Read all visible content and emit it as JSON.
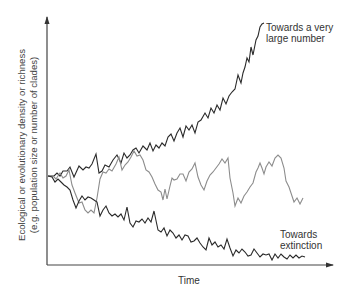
{
  "chart_data": {
    "type": "line",
    "title": "",
    "xlabel": "Time",
    "ylabel": "Ecological or evolutionary density or richness (e.g. population size or number of clades)",
    "ylabel_lines": [
      "Ecological or evolutionary density or richness",
      "(e.g. population size or number of clades)"
    ],
    "grid": false,
    "legend": "none",
    "annotations": [
      {
        "text_lines": [
          "Towards a very",
          "large number"
        ],
        "near_series": "upward"
      },
      {
        "text_lines": [
          "Towards",
          "extinction"
        ],
        "near_series": "downward"
      }
    ],
    "series": [
      {
        "name": "upward",
        "description": "Random walk trending towards a very large number",
        "color": "#2a2a2a",
        "points": [
          [
            48,
            176
          ],
          [
            54,
            176
          ],
          [
            57,
            173
          ],
          [
            60,
            176
          ],
          [
            63,
            171
          ],
          [
            67,
            171
          ],
          [
            70,
            167
          ],
          [
            74,
            177
          ],
          [
            79,
            166
          ],
          [
            83,
            170
          ],
          [
            86,
            167
          ],
          [
            89,
            168
          ],
          [
            92,
            164
          ],
          [
            96,
            154
          ],
          [
            99,
            173
          ],
          [
            102,
            171
          ],
          [
            105,
            165
          ],
          [
            109,
            167
          ],
          [
            113,
            160
          ],
          [
            117,
            155
          ],
          [
            121,
            163
          ],
          [
            124,
            153
          ],
          [
            127,
            158
          ],
          [
            130,
            155
          ],
          [
            133,
            150
          ],
          [
            136,
            148
          ],
          [
            139,
            153
          ],
          [
            143,
            146
          ],
          [
            147,
            150
          ],
          [
            150,
            143
          ],
          [
            153,
            151
          ],
          [
            156,
            145
          ],
          [
            159,
            148
          ],
          [
            162,
            143
          ],
          [
            165,
            146
          ],
          [
            168,
            137
          ],
          [
            171,
            134
          ],
          [
            174,
            141
          ],
          [
            177,
            133
          ],
          [
            180,
            128
          ],
          [
            183,
            137
          ],
          [
            186,
            126
          ],
          [
            189,
            130
          ],
          [
            192,
            125
          ],
          [
            195,
            133
          ],
          [
            198,
            122
          ],
          [
            201,
            120
          ],
          [
            205,
            113
          ],
          [
            208,
            118
          ],
          [
            211,
            108
          ],
          [
            214,
            113
          ],
          [
            217,
            105
          ],
          [
            220,
            110
          ],
          [
            223,
            98
          ],
          [
            226,
            104
          ],
          [
            229,
            96
          ],
          [
            232,
            92
          ],
          [
            235,
            89
          ],
          [
            238,
            75
          ],
          [
            241,
            83
          ],
          [
            243,
            73
          ],
          [
            245,
            67
          ],
          [
            247,
            58
          ],
          [
            249,
            62
          ],
          [
            251,
            47
          ],
          [
            253,
            55
          ],
          [
            256,
            40
          ],
          [
            258,
            36
          ],
          [
            260,
            27
          ],
          [
            262,
            24
          ],
          [
            264,
            23
          ]
        ]
      },
      {
        "name": "fluctuating",
        "description": "Random walk fluctuating around a level",
        "color": "#8c8c8c",
        "points": [
          [
            48,
            176
          ],
          [
            53,
            176
          ],
          [
            56,
            179
          ],
          [
            60,
            173
          ],
          [
            63,
            178
          ],
          [
            66,
            176
          ],
          [
            69,
            170
          ],
          [
            72,
            185
          ],
          [
            75,
            193
          ],
          [
            79,
            203
          ],
          [
            82,
            202
          ],
          [
            85,
            210
          ],
          [
            88,
            213
          ],
          [
            91,
            210
          ],
          [
            94,
            213
          ],
          [
            97,
            198
          ],
          [
            100,
            179
          ],
          [
            103,
            172
          ],
          [
            106,
            173
          ],
          [
            109,
            169
          ],
          [
            112,
            171
          ],
          [
            116,
            164
          ],
          [
            119,
            157
          ],
          [
            122,
            170
          ],
          [
            125,
            165
          ],
          [
            128,
            162
          ],
          [
            131,
            157
          ],
          [
            134,
            151
          ],
          [
            137,
            156
          ],
          [
            140,
            155
          ],
          [
            143,
            160
          ],
          [
            146,
            170
          ],
          [
            149,
            172
          ],
          [
            152,
            177
          ],
          [
            155,
            184
          ],
          [
            158,
            190
          ],
          [
            161,
            192
          ],
          [
            163,
            200
          ],
          [
            165,
            189
          ],
          [
            167,
            199
          ],
          [
            170,
            186
          ],
          [
            172,
            178
          ],
          [
            174,
            180
          ],
          [
            177,
            179
          ],
          [
            180,
            174
          ],
          [
            183,
            174
          ],
          [
            186,
            181
          ],
          [
            189,
            172
          ],
          [
            192,
            169
          ],
          [
            195,
            163
          ],
          [
            198,
            177
          ],
          [
            201,
            185
          ],
          [
            204,
            190
          ],
          [
            207,
            181
          ],
          [
            210,
            175
          ],
          [
            213,
            172
          ],
          [
            216,
            168
          ],
          [
            219,
            164
          ],
          [
            222,
            159
          ],
          [
            225,
            163
          ],
          [
            228,
            158
          ],
          [
            230,
            178
          ],
          [
            233,
            193
          ],
          [
            235,
            206
          ],
          [
            238,
            198
          ],
          [
            241,
            203
          ],
          [
            244,
            196
          ],
          [
            247,
            192
          ],
          [
            250,
            187
          ],
          [
            253,
            183
          ],
          [
            256,
            172
          ],
          [
            258,
            168
          ],
          [
            260,
            163
          ],
          [
            262,
            168
          ],
          [
            264,
            174
          ],
          [
            266,
            167
          ],
          [
            269,
            162
          ],
          [
            272,
            166
          ],
          [
            275,
            158
          ],
          [
            278,
            155
          ],
          [
            281,
            158
          ],
          [
            284,
            168
          ],
          [
            286,
            181
          ],
          [
            289,
            187
          ],
          [
            292,
            196
          ],
          [
            294,
            202
          ],
          [
            297,
            198
          ],
          [
            300,
            204
          ],
          [
            303,
            198
          ]
        ]
      },
      {
        "name": "downward",
        "description": "Random walk trending towards extinction",
        "color": "#2a2a2a",
        "points": [
          [
            48,
            176
          ],
          [
            52,
            177
          ],
          [
            55,
            182
          ],
          [
            58,
            179
          ],
          [
            61,
            182
          ],
          [
            64,
            185
          ],
          [
            67,
            187
          ],
          [
            70,
            190
          ],
          [
            73,
            200
          ],
          [
            76,
            208
          ],
          [
            79,
            201
          ],
          [
            82,
            196
          ],
          [
            85,
            200
          ],
          [
            88,
            197
          ],
          [
            91,
            198
          ],
          [
            94,
            200
          ],
          [
            97,
            202
          ],
          [
            100,
            216
          ],
          [
            103,
            210
          ],
          [
            106,
            206
          ],
          [
            109,
            213
          ],
          [
            112,
            216
          ],
          [
            115,
            214
          ],
          [
            118,
            217
          ],
          [
            121,
            214
          ],
          [
            124,
            220
          ],
          [
            127,
            207
          ],
          [
            130,
            223
          ],
          [
            133,
            227
          ],
          [
            136,
            221
          ],
          [
            139,
            222
          ],
          [
            142,
            219
          ],
          [
            145,
            223
          ],
          [
            148,
            218
          ],
          [
            151,
            222
          ],
          [
            154,
            211
          ],
          [
            158,
            230
          ],
          [
            161,
            232
          ],
          [
            164,
            228
          ],
          [
            167,
            236
          ],
          [
            170,
            230
          ],
          [
            173,
            233
          ],
          [
            176,
            238
          ],
          [
            179,
            235
          ],
          [
            182,
            240
          ],
          [
            185,
            235
          ],
          [
            188,
            236
          ],
          [
            191,
            242
          ],
          [
            194,
            241
          ],
          [
            197,
            238
          ],
          [
            200,
            243
          ],
          [
            203,
            247
          ],
          [
            206,
            250
          ],
          [
            209,
            238
          ],
          [
            212,
            245
          ],
          [
            215,
            242
          ],
          [
            218,
            247
          ],
          [
            221,
            245
          ],
          [
            224,
            249
          ],
          [
            227,
            239
          ],
          [
            230,
            248
          ],
          [
            233,
            256
          ],
          [
            236,
            250
          ],
          [
            239,
            253
          ],
          [
            242,
            249
          ],
          [
            245,
            252
          ],
          [
            248,
            256
          ],
          [
            251,
            255
          ],
          [
            254,
            249
          ],
          [
            257,
            253
          ],
          [
            260,
            257
          ],
          [
            263,
            254
          ],
          [
            266,
            255
          ],
          [
            269,
            254
          ],
          [
            272,
            260
          ],
          [
            275,
            254
          ],
          [
            278,
            258
          ],
          [
            281,
            254
          ],
          [
            284,
            257
          ],
          [
            287,
            259
          ],
          [
            290,
            255
          ],
          [
            293,
            258
          ],
          [
            296,
            255
          ],
          [
            299,
            258
          ],
          [
            302,
            256
          ],
          [
            305,
            257
          ]
        ]
      }
    ],
    "axes": {
      "x_axis": {
        "y": 265,
        "x_start": 47,
        "x_end": 333,
        "arrow": true,
        "ticks": false
      },
      "y_axis": {
        "x": 47,
        "y_start": 265,
        "y_end": 17,
        "arrow": true,
        "ticks": false
      },
      "xlim": [
        0,
        1
      ],
      "ylim": [
        0,
        1
      ]
    }
  },
  "labels": {
    "x_axis": "Time",
    "y_axis_line1": "Ecological or evolutionary density or richness",
    "y_axis_line2": "(e.g. population size or number of clades)",
    "top_annotation_line1": "Towards a very",
    "top_annotation_line2": "large number",
    "bottom_annotation_line1": "Towards",
    "bottom_annotation_line2": "extinction"
  },
  "colors": {
    "axis": "#444444",
    "dark_line": "#2a2a2a",
    "grey_line": "#8c8c8c",
    "text": "#333333",
    "background": "#ffffff"
  }
}
